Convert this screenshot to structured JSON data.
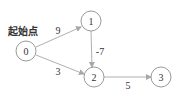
{
  "diagram": {
    "start_label": "起始点",
    "nodes": [
      {
        "id": "0",
        "label": "0",
        "x": 26,
        "y": 51
      },
      {
        "id": "1",
        "label": "1",
        "x": 91,
        "y": 21
      },
      {
        "id": "2",
        "label": "2",
        "x": 94,
        "y": 77
      },
      {
        "id": "3",
        "label": "3",
        "x": 161,
        "y": 76
      }
    ],
    "edges": [
      {
        "from": "0",
        "to": "1",
        "weight": "9"
      },
      {
        "from": "0",
        "to": "2",
        "weight": "3"
      },
      {
        "from": "1",
        "to": "2",
        "weight": "-7"
      },
      {
        "from": "2",
        "to": "3",
        "weight": "5"
      }
    ],
    "colors": {
      "node_stroke": "#9a9a9a",
      "edge": "#b0b0b0",
      "text": "#333333"
    }
  }
}
